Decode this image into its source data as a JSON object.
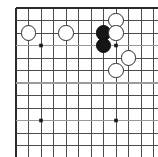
{
  "diagram": {
    "caption": "",
    "board": {
      "type": "go-board",
      "visible_columns": 12,
      "visible_rows": 12,
      "cell_size_px": 12.5,
      "origin_x_px": 16,
      "origin_y_px": 8,
      "edges_shown": [
        "top",
        "left"
      ],
      "line_color": "#3a3a3a",
      "edge_line_color": "#2a2a2a",
      "accent_line_color": "#9a9a9a",
      "background_color": "#ffffff"
    },
    "star_points": [
      {
        "col": 2,
        "row": 3,
        "x": 41,
        "y": 45.5
      },
      {
        "col": 8,
        "row": 3,
        "x": 116,
        "y": 45.5
      },
      {
        "col": 2,
        "row": 9,
        "x": 41,
        "y": 120.5
      },
      {
        "col": 8,
        "row": 9,
        "x": 116,
        "y": 120.5
      }
    ],
    "stones": [
      {
        "color": "white",
        "col": 1,
        "row": 2,
        "x": 28.5,
        "y": 33,
        "radius": 7.6
      },
      {
        "color": "white",
        "col": 4,
        "row": 2,
        "x": 66,
        "y": 33,
        "radius": 7.6
      },
      {
        "color": "white",
        "col": 8,
        "row": 1,
        "x": 116,
        "y": 20.5,
        "radius": 7.6
      },
      {
        "color": "black",
        "col": 7,
        "row": 2,
        "x": 103.5,
        "y": 33,
        "radius": 7.6
      },
      {
        "color": "white",
        "col": 8,
        "row": 2,
        "x": 116,
        "y": 33,
        "radius": 7.6
      },
      {
        "color": "black",
        "col": 7,
        "row": 3,
        "x": 103.5,
        "y": 45.5,
        "radius": 7.6
      },
      {
        "color": "white",
        "col": 9,
        "row": 4,
        "x": 128.5,
        "y": 58,
        "radius": 7.6
      },
      {
        "color": "white",
        "col": 8,
        "row": 5,
        "x": 116,
        "y": 70.5,
        "radius": 7.6
      }
    ],
    "stone_counts": {
      "black": 2,
      "white": 6,
      "total": 8
    },
    "colors": {
      "black_stone": "#161616",
      "white_stone_fill": "#ffffff",
      "white_stone_outline": "#2b2b2b",
      "grid": "#3a3a3a",
      "page_background": "#ffffff"
    }
  }
}
